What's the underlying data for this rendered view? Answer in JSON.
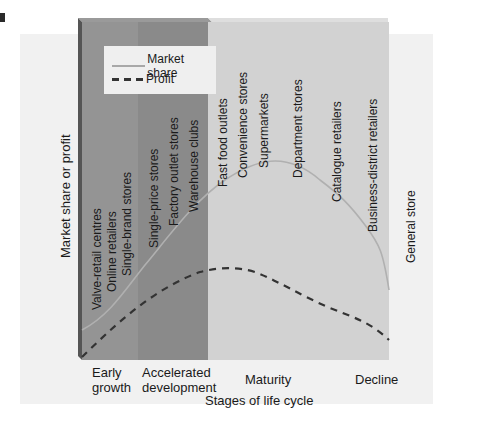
{
  "diagram": {
    "y_axis_label": "Market share or profit",
    "x_axis_label": "Stages of life cycle",
    "legend": [
      {
        "label": "Market share",
        "style": "solid",
        "color": "#a8a8a8"
      },
      {
        "label": "Profit",
        "style": "dashed",
        "color": "#333333"
      }
    ],
    "stages": [
      {
        "label": "Early growth",
        "line1": "Early",
        "line2": "growth",
        "color": "#8f8f8f"
      },
      {
        "label": "Accelerated development",
        "line1": "Accelerated",
        "line2": "development",
        "color": "#868686"
      },
      {
        "label": "Maturity",
        "line1": "Maturity",
        "color": "#cfcfcf"
      },
      {
        "label": "Decline",
        "line1": "Decline",
        "color": "#cfcfcf"
      }
    ],
    "retail_formats": [
      {
        "label": "Valve-retail centres",
        "stage": "Early growth"
      },
      {
        "label": "Online retailers",
        "stage": "Early growth"
      },
      {
        "label": "Single-brand stores",
        "stage": "Early growth"
      },
      {
        "label": "Single-price stores",
        "stage": "Accelerated development"
      },
      {
        "label": "Factory outlet stores",
        "stage": "Accelerated development"
      },
      {
        "label": "Warehouse clubs",
        "stage": "Accelerated development"
      },
      {
        "label": "Fast food outlets",
        "stage": "Maturity"
      },
      {
        "label": "Convenience stores",
        "stage": "Maturity"
      },
      {
        "label": "Supermarkets",
        "stage": "Maturity"
      },
      {
        "label": "Department stores",
        "stage": "Maturity"
      },
      {
        "label": "Catalogue retailers",
        "stage": "Decline"
      },
      {
        "label": "Business-district retailers",
        "stage": "Decline"
      },
      {
        "label": "General store",
        "stage": "Decline"
      }
    ]
  }
}
